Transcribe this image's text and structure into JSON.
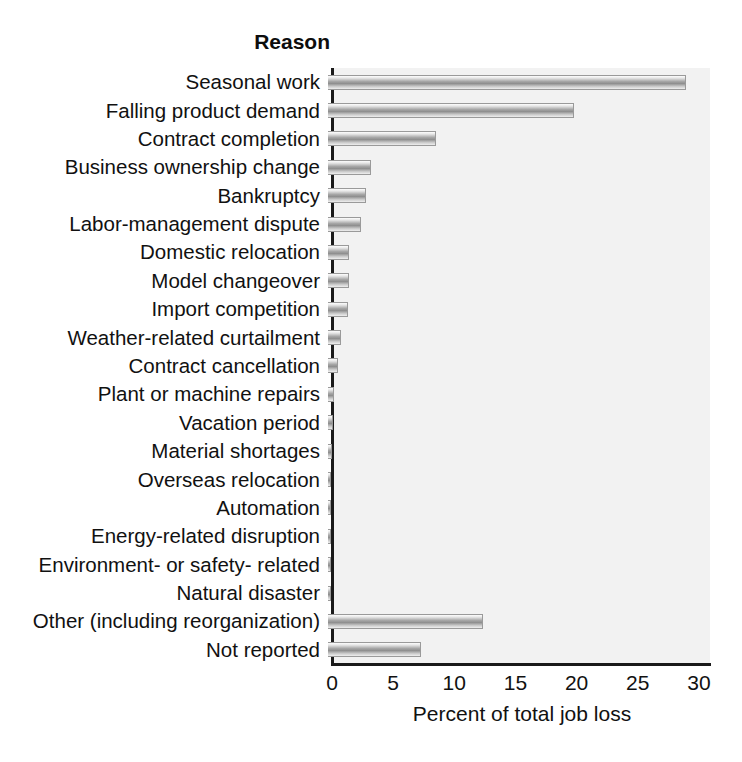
{
  "chart_data": {
    "type": "bar",
    "orientation": "horizontal",
    "title": "Reason",
    "xlabel": "Percent of total job loss",
    "ylabel": "",
    "xlim": [
      0,
      30
    ],
    "xticks": [
      0,
      5,
      10,
      15,
      20,
      25,
      30
    ],
    "grid": false,
    "legend": null,
    "categories": [
      "Seasonal work",
      "Falling product demand",
      "Contract completion",
      "Business ownership change",
      "Bankruptcy",
      "Labor-management dispute",
      "Domestic relocation",
      "Model changeover",
      "Import competition",
      "Weather-related curtailment",
      "Contract cancellation",
      "Plant or machine repairs",
      "Vacation period",
      "Material shortages",
      "Overseas relocation",
      "Automation",
      "Energy-related disruption",
      "Environment- or safety- related",
      "Natural disaster",
      "Other (including reorganization)",
      "Not reported"
    ],
    "values": [
      29.3,
      20.1,
      8.8,
      3.5,
      3.1,
      2.7,
      1.7,
      1.7,
      1.6,
      1.1,
      0.8,
      0.5,
      0.4,
      0.3,
      0.2,
      0.2,
      0.15,
      0.15,
      0.1,
      12.7,
      7.6
    ]
  },
  "colors": {
    "bar_fill": "#a6a6a6",
    "bar_edge": "#9a9a9a",
    "plot_background": "#f2f2f2",
    "axis": "#1a1a1a",
    "text": "#111111"
  }
}
